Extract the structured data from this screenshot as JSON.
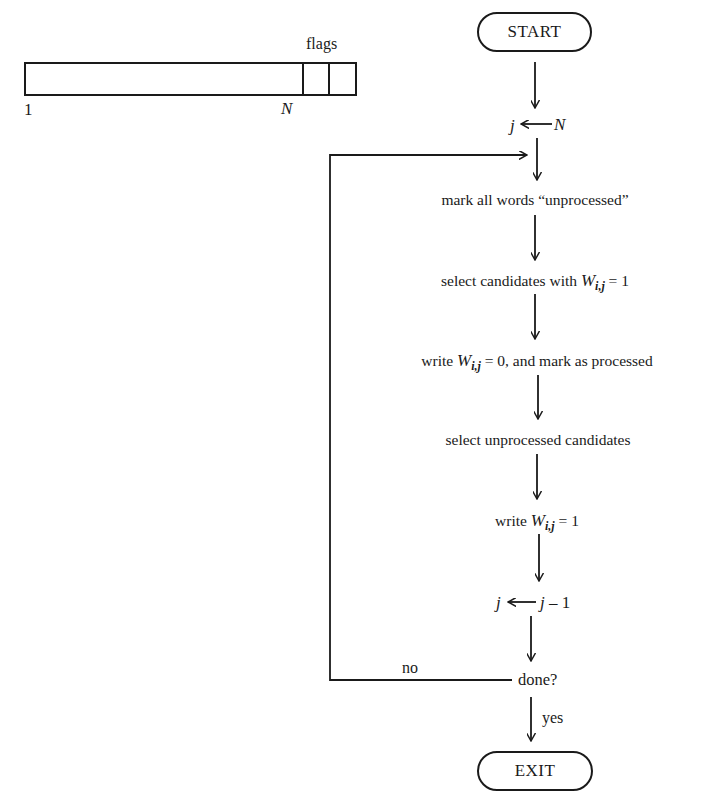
{
  "word_diagram": {
    "flags_label": "flags",
    "left_index": "1",
    "right_index": "N",
    "flag_cells": 2
  },
  "flowchart": {
    "start_label": "START",
    "init": {
      "var": "j",
      "arrow": "←",
      "value": "N"
    },
    "steps": [
      {
        "id": "mark",
        "text": "mark all words “unprocessed”"
      },
      {
        "id": "select1",
        "prefix": "select candidates with ",
        "var": "W",
        "sub": "i,j",
        "suffix": " = 1"
      },
      {
        "id": "write0",
        "prefix": "write ",
        "var": "W",
        "sub": "i,j",
        "suffix": " = 0, and mark as processed"
      },
      {
        "id": "select2",
        "text": "select unprocessed candidates"
      },
      {
        "id": "write1",
        "prefix": "write ",
        "var": "W",
        "sub": "i,j",
        "suffix": " = 1"
      }
    ],
    "decrement": {
      "var": "j",
      "arrow": "←",
      "expr_var": "j",
      "expr_rest": " – 1"
    },
    "decision": {
      "text": "done?",
      "no_label": "no",
      "yes_label": "yes"
    },
    "exit_label": "EXIT"
  },
  "colors": {
    "ink": "#1a1a1a",
    "background": "#ffffff"
  }
}
